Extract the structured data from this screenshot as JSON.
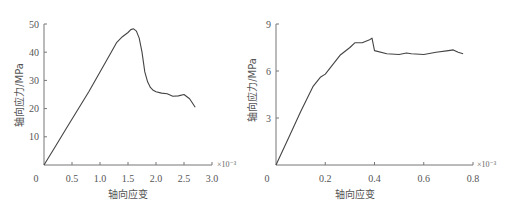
{
  "chart_data": [
    {
      "type": "line",
      "title": "",
      "xlabel": "轴向应变",
      "ylabel": "轴向应力/MPa",
      "x_multiplier": "×10⁻³",
      "xlim": [
        0,
        3.0
      ],
      "ylim": [
        0,
        50
      ],
      "xticks": [
        "0",
        "0.5",
        "1.0",
        "1.5",
        "2.0",
        "2.5",
        "3.0"
      ],
      "yticks": [
        "10",
        "20",
        "30",
        "40",
        "50"
      ],
      "grid": false,
      "series": [
        {
          "name": "stress-strain",
          "x": [
            0,
            0.2,
            0.4,
            0.6,
            0.8,
            1.0,
            1.2,
            1.3,
            1.4,
            1.5,
            1.55,
            1.6,
            1.65,
            1.7,
            1.75,
            1.8,
            1.85,
            1.9,
            1.95,
            2.0,
            2.1,
            2.2,
            2.3,
            2.4,
            2.5,
            2.6,
            2.7
          ],
          "y": [
            0,
            6.5,
            13,
            19.5,
            26,
            33,
            40,
            43.5,
            45.5,
            47,
            48,
            48.3,
            47.5,
            45,
            40,
            33,
            29.5,
            27.5,
            26.5,
            26,
            25.5,
            25.3,
            24.4,
            24.5,
            25,
            23.5,
            20.5
          ]
        }
      ]
    },
    {
      "type": "line",
      "title": "",
      "xlabel": "轴向应变",
      "ylabel": "轴向应力/MPa",
      "x_multiplier": "×10⁻³",
      "xlim": [
        0,
        0.8
      ],
      "ylim": [
        0,
        9
      ],
      "xticks": [
        "0",
        "0.2",
        "0.4",
        "0.6",
        "0.8"
      ],
      "yticks": [
        "3",
        "6",
        "9"
      ],
      "grid": false,
      "series": [
        {
          "name": "stress-strain",
          "x": [
            0,
            0.05,
            0.1,
            0.15,
            0.18,
            0.2,
            0.24,
            0.26,
            0.3,
            0.32,
            0.35,
            0.38,
            0.39,
            0.4,
            0.45,
            0.5,
            0.53,
            0.55,
            0.6,
            0.65,
            0.7,
            0.72,
            0.74,
            0.76
          ],
          "y": [
            0,
            1.7,
            3.4,
            5.0,
            5.6,
            5.8,
            6.6,
            7.0,
            7.5,
            7.8,
            7.8,
            8.0,
            8.1,
            7.3,
            7.1,
            7.05,
            7.15,
            7.1,
            7.05,
            7.2,
            7.3,
            7.35,
            7.2,
            7.1
          ]
        }
      ]
    }
  ],
  "left_chart": {
    "xlabel": "轴向应变",
    "ylabel": "轴向应力/MPa",
    "x_multiplier": "×10⁻³",
    "origin": "0",
    "xticks": [
      "0.5",
      "1.0",
      "1.5",
      "2.0",
      "2.5",
      "3.0"
    ],
    "yticks": [
      "10",
      "20",
      "30",
      "40",
      "50"
    ]
  },
  "right_chart": {
    "xlabel": "轴向应变",
    "ylabel": "轴向应力/MPa",
    "x_multiplier": "×10⁻³",
    "origin": "0",
    "xticks": [
      "0.2",
      "0.4",
      "0.6",
      "0.8"
    ],
    "yticks": [
      "3",
      "6",
      "9"
    ]
  }
}
